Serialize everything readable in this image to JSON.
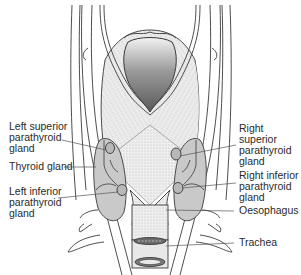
{
  "diagram": {
    "colors": {
      "outline": "#3a3a3a",
      "gland_fill": "#c9c9c9",
      "tissue_fill": "#e6e6e6",
      "cavity_dark": "#6a6a6a",
      "leader_line": "#555555"
    },
    "labels": [
      {
        "id": "left-superior-parathyroid",
        "text": "Left superior\nparathyroid\ngland"
      },
      {
        "id": "thyroid-gland",
        "text": "Thyroid gland"
      },
      {
        "id": "left-inferior-parathyroid",
        "text": "Left inferior\nparathyroid\ngland"
      },
      {
        "id": "right-superior-parathyroid",
        "text": "Right superior\nparathyroid\ngland"
      },
      {
        "id": "right-inferior-parathyroid",
        "text": "Right inferior\nparathyroid\ngland"
      },
      {
        "id": "oesophagus",
        "text": "Oesophagus"
      },
      {
        "id": "trachea",
        "text": "Trachea"
      }
    ]
  }
}
